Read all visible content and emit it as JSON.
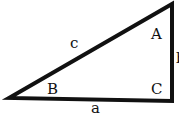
{
  "diagram": {
    "type": "right-triangle",
    "stroke_color": "#111111",
    "background": "#ffffff",
    "vertices": {
      "B": [
        9,
        98
      ],
      "A": [
        172,
        4
      ],
      "C": [
        172,
        101
      ]
    },
    "angle_labels": {
      "A": "A",
      "B": "B",
      "C": "C"
    },
    "side_labels": {
      "a": "a",
      "b": "b",
      "c": "c"
    }
  }
}
